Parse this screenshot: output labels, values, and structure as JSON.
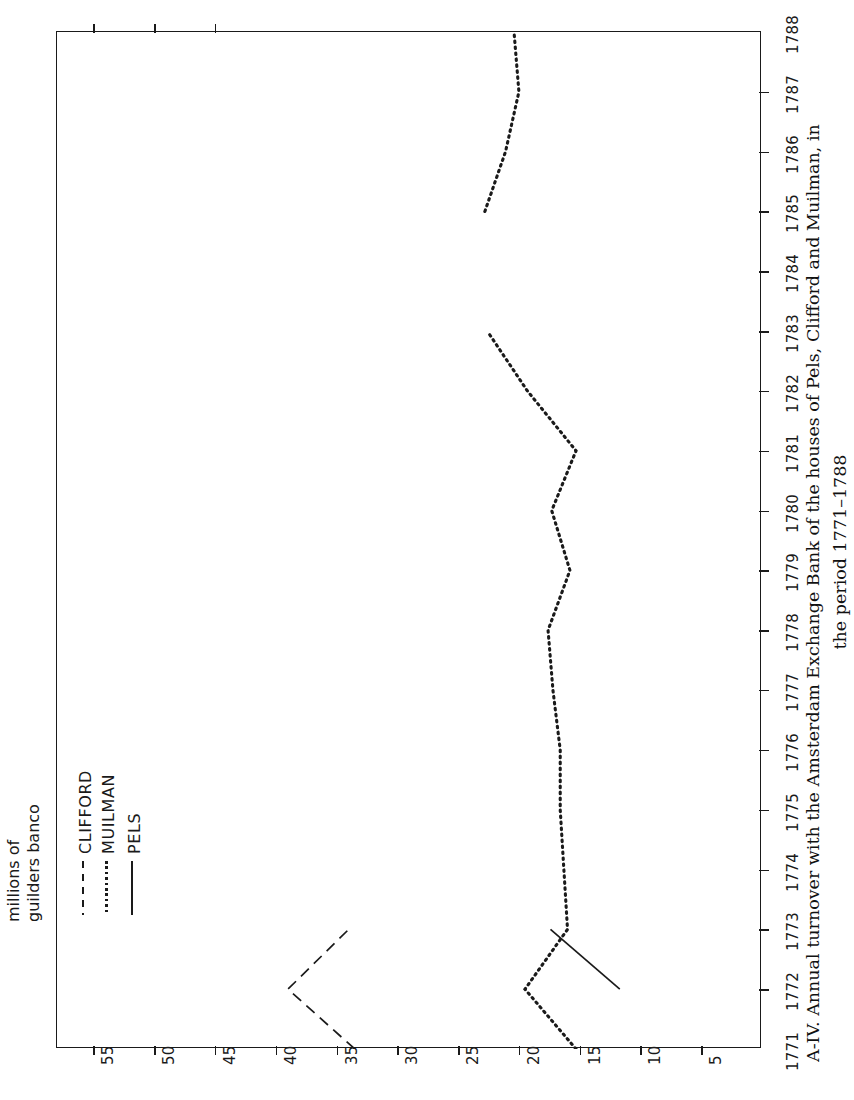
{
  "figure": {
    "caption_line1": "A-IV. Annual turnover with the Amsterdam Exchange Bank of the houses of Pels, Clifford and Muilman, in",
    "caption_line2": "the period 1771–1788",
    "caption_label": "A-IV.",
    "axis_title_line1": "millions of",
    "axis_title_line2": "guilders banco"
  },
  "legend": {
    "position": "upper-left",
    "items": [
      {
        "label": "CLIFFORD",
        "style": "dashed",
        "color": "#1a1a1a"
      },
      {
        "label": "MUILMAN",
        "style": "dotted",
        "color": "#1a1a1a"
      },
      {
        "label": "PELS",
        "style": "solid",
        "color": "#1a1a1a"
      }
    ]
  },
  "chart_data": {
    "type": "line",
    "title": "A-IV. Annual turnover with the Amsterdam Exchange Bank of the houses of Pels, Clifford and Muilman, in the period 1771–1788",
    "orientation": "rotated-90",
    "xlabel": "",
    "ylabel": "millions of guilders banco",
    "x": [
      1771,
      1772,
      1773,
      1774,
      1775,
      1776,
      1777,
      1778,
      1779,
      1780,
      1781,
      1782,
      1783,
      1784,
      1785,
      1786,
      1787,
      1788
    ],
    "xlim": [
      1771,
      1788
    ],
    "ylim": [
      0,
      58
    ],
    "yticks": [
      55,
      50,
      45,
      40,
      35,
      30,
      25,
      20,
      15,
      10,
      5
    ],
    "xticks": [
      1771,
      1772,
      1773,
      1774,
      1775,
      1776,
      1777,
      1778,
      1779,
      1780,
      1781,
      1782,
      1783,
      1784,
      1785,
      1786,
      1787,
      1788
    ],
    "grid": false,
    "series": [
      {
        "name": "CLIFFORD",
        "style": "dashed",
        "color": "#1a1a1a",
        "x": [
          1771,
          1772,
          1773
        ],
        "values": [
          33.5,
          39.0,
          34.0
        ]
      },
      {
        "name": "MUILMAN",
        "style": "dotted",
        "color": "#1a1a1a",
        "x": [
          1771,
          1772,
          1773,
          1774,
          1775,
          1776,
          1777,
          1778,
          1779,
          1780,
          1781,
          1782,
          1783
        ],
        "values": [
          15.3,
          19.5,
          16.0,
          16.3,
          16.6,
          16.6,
          17.2,
          17.6,
          15.8,
          17.3,
          15.3,
          19.3,
          22.6
        ]
      },
      {
        "name": "MUILMAN (later)",
        "style": "dotted",
        "color": "#1a1a1a",
        "x": [
          1785,
          1786,
          1787,
          1788
        ],
        "values": [
          22.8,
          21.1,
          20.0,
          20.4
        ]
      },
      {
        "name": "PELS",
        "style": "solid",
        "color": "#1a1a1a",
        "x": [
          1772,
          1773
        ],
        "values": [
          11.7,
          17.4
        ]
      }
    ]
  },
  "value_axis": {
    "ticks": [
      {
        "value": 55,
        "label": "55"
      },
      {
        "value": 50,
        "label": "50"
      },
      {
        "value": 45,
        "label": "45"
      },
      {
        "value": 40,
        "label": "40"
      },
      {
        "value": 35,
        "label": "35"
      },
      {
        "value": 30,
        "label": "30"
      },
      {
        "value": 25,
        "label": "25"
      },
      {
        "value": 20,
        "label": "20"
      },
      {
        "value": 15,
        "label": "15"
      },
      {
        "value": 10,
        "label": "10"
      },
      {
        "value": 5,
        "label": "5"
      }
    ]
  },
  "year_axis": {
    "ticks": [
      {
        "value": 1771,
        "label": "1771"
      },
      {
        "value": 1772,
        "label": "1772"
      },
      {
        "value": 1773,
        "label": "1773"
      },
      {
        "value": 1774,
        "label": "1774"
      },
      {
        "value": 1775,
        "label": "1775"
      },
      {
        "value": 1776,
        "label": "1776"
      },
      {
        "value": 1777,
        "label": "1777"
      },
      {
        "value": 1778,
        "label": "1778"
      },
      {
        "value": 1779,
        "label": "1779"
      },
      {
        "value": 1780,
        "label": "1780"
      },
      {
        "value": 1781,
        "label": "1781"
      },
      {
        "value": 1782,
        "label": "1782"
      },
      {
        "value": 1783,
        "label": "1783"
      },
      {
        "value": 1784,
        "label": "1784"
      },
      {
        "value": 1785,
        "label": "1785"
      },
      {
        "value": 1786,
        "label": "1786"
      },
      {
        "value": 1787,
        "label": "1787"
      },
      {
        "value": 1788,
        "label": "1788"
      }
    ]
  }
}
